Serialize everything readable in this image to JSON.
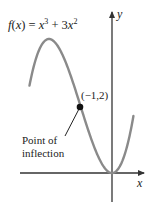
{
  "figure": {
    "function_label": "f(x) = x³ + 3x²",
    "function_parts": {
      "f": "f",
      "lparen": "(",
      "x": "x",
      "rparen_eq": ") = ",
      "x1": "x",
      "exp1": "3",
      "plus": " + 3",
      "x2": "x",
      "exp2": "2"
    },
    "x_axis_label": "x",
    "y_axis_label": "y",
    "point_label": "(−1,2)",
    "annotation_line1": "Point of",
    "annotation_line2": "inflection",
    "colors": {
      "curve": "#8a8a8a",
      "axes": "#333333",
      "point": "#111111",
      "text": "#222222"
    }
  },
  "chart_data": {
    "type": "line",
    "xlabel": "x",
    "ylabel": "y",
    "series": [
      {
        "name": "f(x) = x^3 + 3x^2",
        "x": [
          -2.6,
          -2.4,
          -2.2,
          -2.0,
          -1.8,
          -1.6,
          -1.4,
          -1.2,
          -1.0,
          -0.8,
          -0.6,
          -0.4,
          -0.2,
          0.0,
          0.2,
          0.4,
          0.6
        ],
        "values": [
          2.7,
          3.46,
          3.87,
          4.0,
          3.89,
          3.58,
          3.14,
          2.59,
          2.0,
          1.41,
          0.86,
          0.42,
          0.11,
          0.0,
          0.13,
          0.54,
          1.3
        ]
      }
    ],
    "annotations": [
      {
        "x": -1,
        "y": 2,
        "label": "(−1,2)",
        "note": "Point of inflection"
      }
    ],
    "grid": false
  }
}
